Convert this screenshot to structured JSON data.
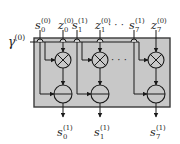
{
  "diagram": {
    "box": {
      "x": 34,
      "y": 38,
      "w": 136,
      "h": 69,
      "fill": "#c8c8c8",
      "stroke": "#3a3a3a"
    },
    "line_color": "#1a1a1a",
    "gamma_label": {
      "base": "γ",
      "sup": "(0)"
    },
    "ellipsis": "· · ·",
    "columns": [
      {
        "cx": 63,
        "s_in": {
          "base": "s",
          "sub": "0",
          "sup": "(0)"
        },
        "z_in": {
          "base": "z",
          "sub": "0",
          "sup": "(0)"
        },
        "s_out": {
          "base": "s",
          "sub": "0",
          "sup": "(1)"
        },
        "s_line_x": 40,
        "g_branch_x": 45,
        "z_hop": true
      },
      {
        "cx": 100,
        "s_in": {
          "base": "s",
          "sub": "1",
          "sup": "(1)"
        },
        "z_in": {
          "base": "z",
          "sub": "1",
          "sup": "(0)"
        },
        "s_out": {
          "base": "s",
          "sub": "1",
          "sup": "(1)"
        },
        "s_line_x": 77,
        "g_branch_x": 82,
        "z_hop": true
      },
      {
        "cx": 156,
        "s_in": {
          "base": "s",
          "sub": "7",
          "sup": "(1)"
        },
        "z_in": {
          "base": "z",
          "sub": "7",
          "sup": "(0)"
        },
        "s_out": {
          "base": "s",
          "sub": "7",
          "sup": "(1)"
        },
        "s_line_x": 134,
        "g_branch_x": 139,
        "z_hop": false
      }
    ],
    "multiply_node": {
      "symbol": "⊗",
      "cy": 60,
      "r": 8
    },
    "subtract_node": {
      "symbol": "⊖",
      "cy": 94,
      "r": 9
    },
    "bus_y": 42
  }
}
